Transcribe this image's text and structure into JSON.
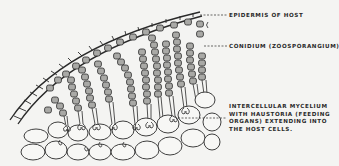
{
  "figure": {
    "colors": {
      "background": "#f4f4f2",
      "ink": "#2a2a2a",
      "spore_fill": "#a9a9a6",
      "cell_fill": "#f7f7f5"
    }
  },
  "labels": {
    "epidermis": "Epidermis of Host",
    "conidium": "Conidium (Zoosporangium)",
    "mycelium_line1": "Intercellular Mycelium",
    "mycelium_line2": "with Haustoria (Feeding",
    "mycelium_line3": "Organs) Extending Into",
    "mycelium_line4": "The Host Cells."
  }
}
